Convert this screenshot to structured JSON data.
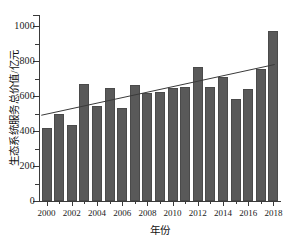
{
  "chart_data": {
    "type": "bar",
    "title": "",
    "xlabel": "年份",
    "ylabel": "生态系统服务总价值/亿元",
    "categories": [
      2000,
      2001,
      2002,
      2003,
      2004,
      2005,
      2006,
      2007,
      2008,
      2009,
      2010,
      2011,
      2012,
      2013,
      2014,
      2015,
      2016,
      2017,
      2018
    ],
    "values": [
      417,
      500,
      437,
      670,
      545,
      648,
      533,
      663,
      620,
      625,
      645,
      653,
      768,
      652,
      710,
      583,
      640,
      757,
      972
    ],
    "series": [
      {
        "name": "生态系统服务总价值",
        "type": "bar",
        "values": [
          417,
          500,
          437,
          670,
          545,
          648,
          533,
          663,
          620,
          625,
          645,
          653,
          768,
          652,
          710,
          583,
          640,
          757,
          972
        ]
      },
      {
        "name": "趋势线",
        "type": "line",
        "x": [
          2000,
          2018
        ],
        "values": [
          490,
          780
        ]
      }
    ],
    "ylim": [
      0,
      1080
    ],
    "xlim": [
      1999.4,
      2018.6
    ],
    "ytick_labels": [
      "0",
      "200",
      "400",
      "600",
      "800",
      "1000"
    ],
    "ytick_values": [
      0,
      200,
      400,
      600,
      800,
      1000
    ],
    "ytick_minor_values": [
      100,
      300,
      500,
      700,
      900
    ],
    "xtick_labels": [
      "2000",
      "2002",
      "2004",
      "2006",
      "2008",
      "2010",
      "2012",
      "2014",
      "2016",
      "2018"
    ],
    "xtick_values": [
      2000,
      2002,
      2004,
      2006,
      2008,
      2010,
      2012,
      2014,
      2016,
      2018
    ],
    "grid": false,
    "legend": "none",
    "bar_color": "#595959",
    "trend_color": "#3a3a3a",
    "axis_color": "#3a3a3a",
    "background": "#ffffff"
  }
}
